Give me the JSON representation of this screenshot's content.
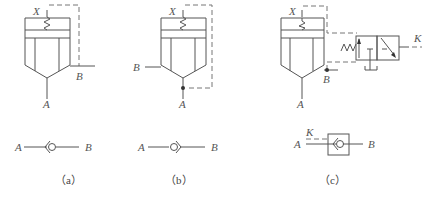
{
  "figure": {
    "panels": [
      {
        "id": "a",
        "caption": "（a）",
        "labels": {
          "x": "X",
          "a": "A",
          "b": "B"
        },
        "symbol_labels": {
          "a": "A",
          "b": "B"
        }
      },
      {
        "id": "b",
        "caption": "（b）",
        "labels": {
          "x": "X",
          "a": "A",
          "b": "B"
        },
        "symbol_labels": {
          "a": "A",
          "b": "B"
        }
      },
      {
        "id": "c",
        "caption": "（c）",
        "labels": {
          "x": "X",
          "a": "A",
          "b": "B",
          "k": "K"
        },
        "symbol_labels": {
          "a": "A",
          "b": "B",
          "k": "K"
        }
      }
    ],
    "colors": {
      "line": "#555555",
      "dash": "#777777",
      "background": "#ffffff"
    }
  }
}
